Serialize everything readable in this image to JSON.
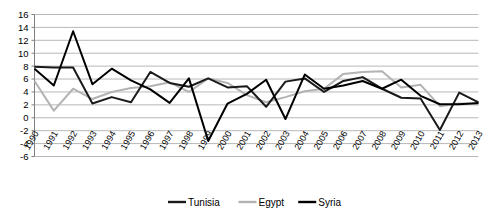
{
  "chart_data": {
    "type": "line",
    "title": "",
    "subtitle": "",
    "xlabel": "",
    "ylabel": "",
    "ylim": [
      -6,
      16
    ],
    "ytick_step": 2,
    "yticks": [
      16,
      14,
      12,
      10,
      8,
      6,
      4,
      2,
      0,
      -2,
      -4,
      -6
    ],
    "grid": true,
    "grid_axis": "y",
    "legend_position": "bottom",
    "categories": [
      "1990",
      "1991",
      "1992",
      "1993",
      "1994",
      "1995",
      "1996",
      "1997",
      "1998",
      "1999",
      "2000",
      "2001",
      "2002",
      "2003",
      "2004",
      "2005",
      "2006",
      "2007",
      "2008",
      "2009",
      "2010",
      "2011",
      "2012",
      "2013"
    ],
    "series": [
      {
        "name": "Tunisia",
        "color": "#1a1a1a",
        "width": 2.0,
        "values": [
          7.9,
          7.8,
          7.8,
          2.2,
          3.2,
          2.4,
          7.1,
          5.4,
          4.8,
          6.1,
          4.7,
          4.9,
          1.7,
          5.6,
          6.1,
          4.0,
          5.7,
          6.3,
          4.5,
          3.1,
          3.0,
          -1.9,
          3.9,
          2.4
        ]
      },
      {
        "name": "Egypt",
        "color": "#b3b3b3",
        "width": 2.0,
        "values": [
          5.7,
          1.1,
          4.5,
          2.9,
          4.0,
          4.6,
          4.9,
          5.5,
          4.0,
          6.1,
          5.4,
          3.5,
          2.4,
          3.2,
          4.1,
          4.5,
          6.8,
          7.1,
          7.2,
          4.7,
          5.1,
          1.8,
          2.2,
          2.1
        ]
      },
      {
        "name": "Syria",
        "color": "#000000",
        "width": 2.0,
        "values": [
          7.6,
          5.0,
          13.4,
          5.2,
          7.6,
          5.8,
          4.4,
          2.3,
          6.1,
          -3.6,
          2.2,
          3.7,
          5.9,
          -0.2,
          6.7,
          4.5,
          5.0,
          5.7,
          4.5,
          5.9,
          3.4,
          2.1,
          2.1,
          2.3
        ]
      }
    ]
  },
  "legend": {
    "items": [
      {
        "label": "Tunisia",
        "color": "#1a1a1a"
      },
      {
        "label": "Egypt",
        "color": "#b3b3b3"
      },
      {
        "label": "Syria",
        "color": "#000000"
      }
    ]
  }
}
